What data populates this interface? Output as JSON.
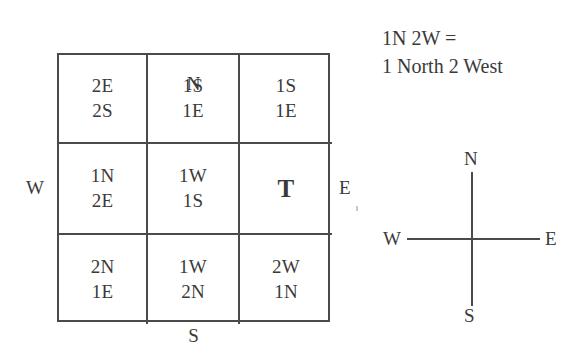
{
  "figure": {
    "grid": {
      "rows": [
        [
          {
            "name": "cell-nw",
            "lines": [
              "2E",
              "2S"
            ],
            "bold": false
          },
          {
            "name": "cell-n",
            "lines": [
              "1S",
              "1E"
            ],
            "bold": false
          },
          {
            "name": "cell-ne",
            "lines": [
              "1S",
              "1E"
            ],
            "bold": false
          }
        ],
        [
          {
            "name": "cell-w",
            "lines": [
              "1N",
              "2E"
            ],
            "bold": false
          },
          {
            "name": "cell-center",
            "lines": [
              "1W",
              "1S"
            ],
            "bold": false
          },
          {
            "name": "cell-e",
            "lines": [
              "T"
            ],
            "bold": true
          }
        ],
        [
          {
            "name": "cell-sw",
            "lines": [
              "2N",
              "1E"
            ],
            "bold": false
          },
          {
            "name": "cell-s",
            "lines": [
              "1W",
              "2N"
            ],
            "bold": false
          },
          {
            "name": "cell-se",
            "lines": [
              "2W",
              "1N"
            ],
            "bold": false
          }
        ]
      ],
      "edge_labels": {
        "north": "N",
        "south": "S",
        "west": "W",
        "east": "E"
      }
    },
    "legend": {
      "line1": "1N 2W =",
      "line2": "1 North 2 West"
    },
    "compass_rose": {
      "north": "N",
      "south": "S",
      "west": "W",
      "east": "E"
    },
    "colors": {
      "ink": "#3a3a3a",
      "rule": "#4a4a4a",
      "background": "#ffffff"
    }
  }
}
